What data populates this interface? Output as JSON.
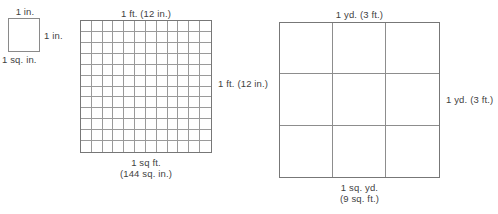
{
  "figures": [
    {
      "id": "square-inch",
      "shape": "square",
      "rows": 1,
      "cols": 1,
      "top_label": "1 in.",
      "right_label": "1 in.",
      "bottom_label_line1": "1 sq. in.",
      "bottom_label_line2": ""
    },
    {
      "id": "square-foot",
      "shape": "grid",
      "rows": 12,
      "cols": 12,
      "top_label": "1 ft. (12 in.)",
      "right_label": "1 ft. (12 in.)",
      "bottom_label_line1": "1 sq ft.",
      "bottom_label_line2": "(144 sq. in.)"
    },
    {
      "id": "square-yard",
      "shape": "grid",
      "rows": 3,
      "cols": 3,
      "top_label": "1 yd. (3 ft.)",
      "right_label": "1 yd. (3 ft.)",
      "bottom_label_line1": "1 sq. yd.",
      "bottom_label_line2": "(9 sq. ft.)"
    }
  ],
  "colors": {
    "background": "#ffffff",
    "text": "#3f3f3f",
    "outer_border": "#777777",
    "grid_line": "#9a9a9a"
  },
  "artifact": {
    "top_clipped_text": ""
  }
}
